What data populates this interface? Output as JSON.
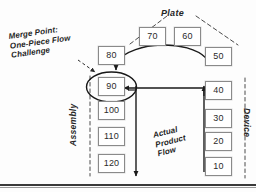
{
  "diagram": {
    "title_region": "value stream merge point diagram",
    "labels": {
      "plate": "Plate",
      "assembly": "Assembly",
      "device": "Device"
    },
    "annotations": {
      "merge_point": {
        "line1": "Merge Point:",
        "line2": "One-Piece Flow",
        "line3": "Challenge"
      },
      "actual_flow": {
        "line1": "Actual",
        "line2": "Product",
        "line3": "Flow"
      }
    },
    "boxes": [
      {
        "id": "box-70",
        "value": "70",
        "x": 139,
        "y": 27,
        "w": 27,
        "h": 19
      },
      {
        "id": "box-60",
        "value": "60",
        "x": 174,
        "y": 27,
        "w": 27,
        "h": 19
      },
      {
        "id": "box-80",
        "value": "80",
        "x": 98,
        "y": 46,
        "w": 27,
        "h": 19
      },
      {
        "id": "box-50",
        "value": "50",
        "x": 205,
        "y": 47,
        "w": 27,
        "h": 19
      },
      {
        "id": "box-90",
        "value": "90",
        "x": 98,
        "y": 77,
        "w": 27,
        "h": 19
      },
      {
        "id": "box-40",
        "value": "40",
        "x": 205,
        "y": 81,
        "w": 27,
        "h": 19
      },
      {
        "id": "box-100",
        "value": "100",
        "x": 98,
        "y": 101,
        "w": 27,
        "h": 19
      },
      {
        "id": "box-30",
        "value": "30",
        "x": 205,
        "y": 109,
        "w": 27,
        "h": 19
      },
      {
        "id": "box-110",
        "value": "110",
        "x": 98,
        "y": 127,
        "w": 27,
        "h": 19
      },
      {
        "id": "box-20",
        "value": "20",
        "x": 205,
        "y": 132,
        "w": 27,
        "h": 19
      },
      {
        "id": "box-120",
        "value": "120",
        "x": 98,
        "y": 154,
        "w": 27,
        "h": 19
      },
      {
        "id": "box-10",
        "value": "10",
        "x": 205,
        "y": 157,
        "w": 27,
        "h": 19
      }
    ],
    "colors": {
      "box_border": "#8a8a8a",
      "box_fill": "#ffffff",
      "arrow": "#1a1a1a",
      "dashed_guide": "#4a4a4a",
      "text": "#1f1f1f",
      "rule": "#3a3a3a"
    }
  }
}
